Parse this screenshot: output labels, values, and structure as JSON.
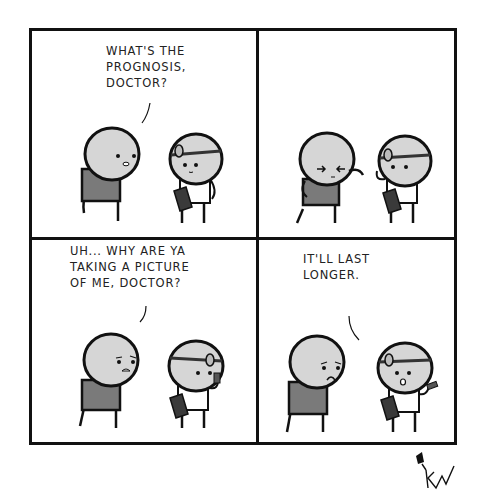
{
  "comic": {
    "panels": [
      {
        "id": 1,
        "speaker": "patient",
        "caption": "WHAT'S THE\nPROGNOSIS,\nDOCTOR?"
      },
      {
        "id": 2,
        "speaker": "none",
        "caption": ""
      },
      {
        "id": 3,
        "speaker": "patient",
        "caption": "UH... WHY ARE YA\nTAKING A PICTURE\nOF ME, DOCTOR?"
      },
      {
        "id": 4,
        "speaker": "doctor",
        "caption": "IT'LL LAST\nLONGER."
      }
    ],
    "signature": "KW"
  },
  "colors": {
    "ink": "#111111",
    "head": "#d6d6d6",
    "shirt": "#7a7a7a",
    "clipboard": "#3a3a3a",
    "background": "#ffffff"
  }
}
